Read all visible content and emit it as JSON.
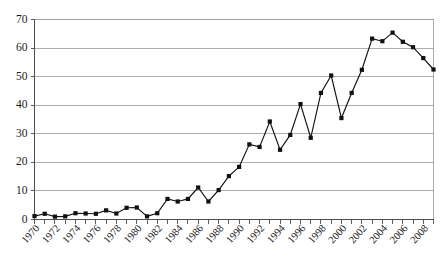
{
  "chart_data": {
    "type": "line",
    "title": "",
    "subtitle": "",
    "xlabel": "",
    "ylabel": "",
    "ylim": [
      0,
      70
    ],
    "xlim": [
      1970,
      2009
    ],
    "y_ticks": [
      0,
      10,
      20,
      30,
      40,
      50,
      60,
      70
    ],
    "y_tick_labels": [
      "0",
      "10",
      "20",
      "30",
      "40",
      "50",
      "60",
      "70"
    ],
    "x_tick_labels": [
      "1970",
      "1972",
      "1974",
      "1976",
      "1978",
      "1980",
      "1982",
      "1984",
      "1986",
      "1988",
      "1990",
      "1992",
      "1994",
      "1996",
      "1998",
      "2000",
      "2002",
      "2004",
      "2006",
      "2008"
    ],
    "x_tick_label_interval": 2,
    "x_minor_ticks_every": 1,
    "grid": "horizontal",
    "legend": "none",
    "marker": "square",
    "marker_color": "#111111",
    "line_color": "#111111",
    "grid_color": "#9a9a9a",
    "axis_color": "#4d4d4d",
    "x": [
      1970,
      1971,
      1972,
      1973,
      1974,
      1975,
      1976,
      1977,
      1978,
      1979,
      1980,
      1981,
      1982,
      1983,
      1984,
      1985,
      1986,
      1987,
      1988,
      1989,
      1990,
      1991,
      1992,
      1993,
      1994,
      1995,
      1996,
      1997,
      1998,
      1999,
      2000,
      2001,
      2002,
      2003,
      2004,
      2005,
      2006,
      2007,
      2008,
      2009
    ],
    "values": [
      1.2,
      2.0,
      1.0,
      1.1,
      2.2,
      2.1,
      2.0,
      3.2,
      2.1,
      4.1,
      4.2,
      1.1,
      2.2,
      7.2,
      6.3,
      7.2,
      11.2,
      6.3,
      10.3,
      15.2,
      18.4,
      26.3,
      25.4,
      34.3,
      24.4,
      29.6,
      40.4,
      28.6,
      44.3,
      50.4,
      35.5,
      44.3,
      52.4,
      63.3,
      62.4,
      65.4,
      62.2,
      60.3,
      56.5,
      52.5
    ]
  }
}
